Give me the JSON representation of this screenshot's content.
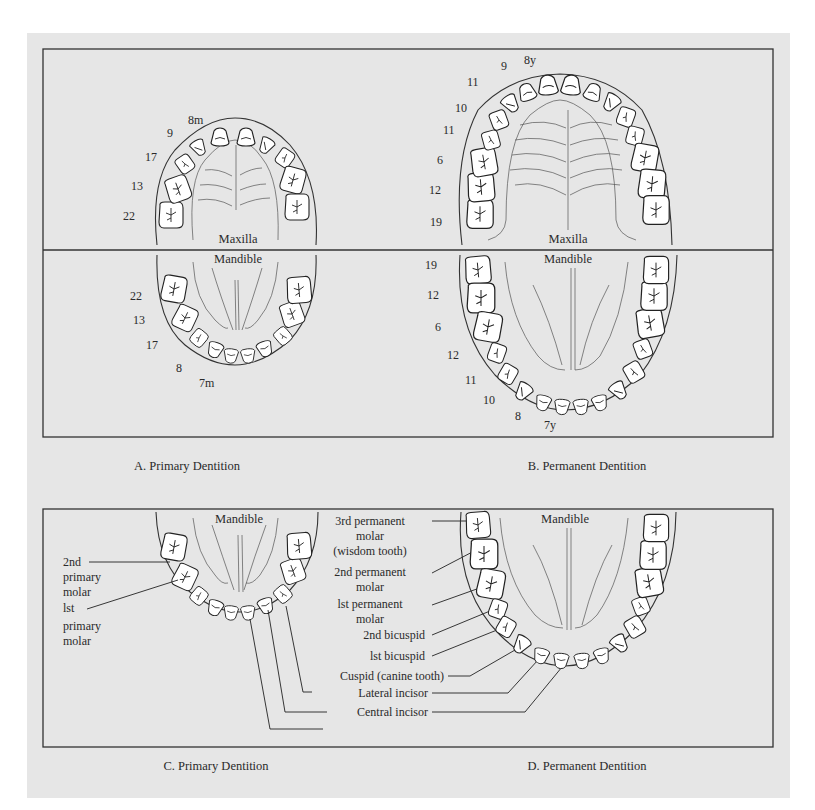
{
  "panels": {
    "A": {
      "caption": "A. Primary Dentition",
      "maxilla_label": "Maxilla",
      "mandible_label": "Mandible",
      "upper_eruption_labels": [
        "8m",
        "9",
        "17",
        "13",
        "22"
      ],
      "lower_eruption_labels": [
        "22",
        "13",
        "17",
        "8",
        "7m"
      ]
    },
    "B": {
      "caption": "B. Permanent Dentition",
      "maxilla_label": "Maxilla",
      "mandible_label": "Mandible",
      "upper_eruption_labels": [
        "8y",
        "9",
        "11",
        "10",
        "11",
        "6",
        "12",
        "19"
      ],
      "lower_eruption_labels": [
        "19",
        "12",
        "6",
        "12",
        "11",
        "10",
        "8",
        "7y"
      ]
    },
    "C": {
      "caption": "C. Primary Dentition",
      "mandible_label": "Mandible",
      "labels": {
        "second_primary_molar": [
          "2nd",
          "primary",
          "molar"
        ],
        "first_primary_molar": [
          "lst",
          "primary",
          "molar"
        ]
      }
    },
    "D": {
      "caption": "D. Permanent Dentition",
      "mandible_label": "Mandible",
      "labels": {
        "third_molar": [
          "3rd permanent",
          "molar",
          "(wisdom tooth)"
        ],
        "second_molar": [
          "2nd permanent",
          "molar"
        ],
        "first_molar": [
          "lst permanent",
          "molar"
        ],
        "second_bicuspid": "2nd bicuspid",
        "first_bicuspid": "lst bicuspid",
        "cuspid": "Cuspid (canine tooth)",
        "lateral_incisor": "Lateral incisor",
        "central_incisor": "Central incisor"
      }
    }
  },
  "colors": {
    "panel_bg": "#e6e6e6",
    "page_bg": "#ffffff",
    "line": "#222222",
    "tooth": "#ffffff"
  }
}
